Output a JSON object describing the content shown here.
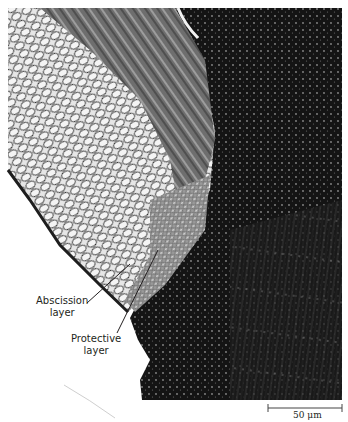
{
  "figure": {
    "labels": [
      {
        "id": "abscission",
        "line1": "Abscission",
        "line2": "layer"
      },
      {
        "id": "protective",
        "line1": "Protective",
        "line2": "layer"
      }
    ],
    "scale_bar": {
      "text": "50 μm",
      "length_um": 50
    },
    "colors": {
      "background": "#ffffff",
      "tissue_light": "#d9d9d9",
      "tissue_dark": "#141414",
      "label_text": "#231f20"
    }
  }
}
